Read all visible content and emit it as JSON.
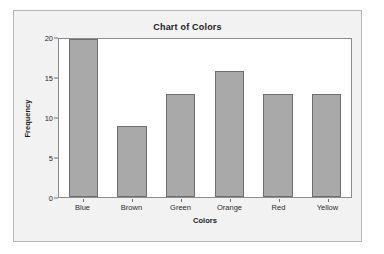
{
  "figure": {
    "panel_bg": "#f2f2f2",
    "panel_border": "#b4b4b4",
    "plot_bg": "#ffffff",
    "axis_color": "#8c8c8c"
  },
  "chart_data": {
    "type": "bar",
    "title": "Chart of Colors",
    "xlabel": "Colors",
    "ylabel": "Frequency",
    "categories": [
      "Blue",
      "Brown",
      "Green",
      "Orange",
      "Red",
      "Yellow"
    ],
    "values": [
      20,
      9,
      13,
      16,
      13,
      13
    ],
    "ylim": [
      0,
      20
    ],
    "yticks": [
      0,
      5,
      10,
      15,
      20
    ],
    "ytick_labels": [
      "0",
      "5",
      "10",
      "15",
      "20"
    ],
    "grid": false,
    "legend": false,
    "bar_fill": "#a9a9a9",
    "bar_edge": "#6e6e6e"
  }
}
